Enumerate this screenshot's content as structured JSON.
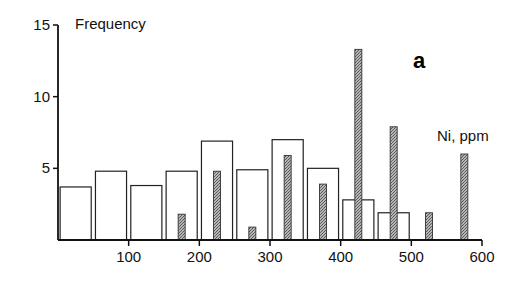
{
  "chart_data": {
    "type": "bar",
    "title": "",
    "panel_label": "a",
    "xlabel": "Ni, ppm",
    "ylabel": "Frequency",
    "xlim": [
      0,
      600
    ],
    "ylim": [
      0,
      15
    ],
    "xticks": [
      100,
      200,
      300,
      400,
      500,
      600
    ],
    "yticks": [
      5,
      10,
      15
    ],
    "grid": false,
    "legend": null,
    "bin_width": 50,
    "series": [
      {
        "name": "open (unshaded) histogram",
        "style": "outline",
        "bin_centers": [
          25,
          75,
          125,
          175,
          225,
          275,
          325,
          375,
          425,
          475
        ],
        "values": [
          3.7,
          4.8,
          3.8,
          4.8,
          6.9,
          4.9,
          7.0,
          5.0,
          2.8,
          1.9
        ]
      },
      {
        "name": "shaded histogram",
        "style": "stippled",
        "bin_centers": [
          175,
          225,
          275,
          325,
          375,
          425,
          475,
          525,
          575
        ],
        "values": [
          1.8,
          4.8,
          0.9,
          5.9,
          3.9,
          13.3,
          7.9,
          1.9,
          6.0
        ]
      }
    ]
  },
  "labels": {
    "ylabel": "Frequency",
    "xlabel": "Ni, ppm",
    "panel": "a"
  },
  "colors": {
    "axis": "#111111",
    "outline_bar": "#222222",
    "shaded_bar": "#9a9a9a",
    "background": "#ffffff"
  }
}
